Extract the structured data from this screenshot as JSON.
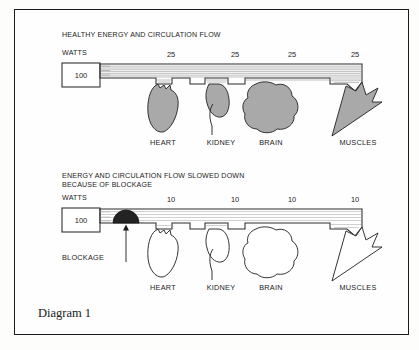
{
  "figure": {
    "caption": "Diagram 1",
    "border_color": "#1b1b1b",
    "background": "#fdfdfc"
  },
  "panels": [
    {
      "id": "healthy",
      "title": "HEALTHY ENERGY AND CIRCULATION FLOW",
      "units_label": "WATTS",
      "source_value": "100",
      "flow_state": "healthy",
      "organ_fill_color": "#a9a9a9",
      "branches": [
        {
          "label": "HEART",
          "watts": "25"
        },
        {
          "label": "KIDNEY",
          "watts": "25"
        },
        {
          "label": "BRAIN",
          "watts": "25"
        },
        {
          "label": "MUSCLES",
          "watts": "25"
        }
      ]
    },
    {
      "id": "blocked",
      "title_line1": "ENERGY AND CIRCULATION FLOW SLOWED DOWN",
      "title_line2": "BECAUSE OF BLOCKAGE",
      "units_label": "WATTS",
      "source_value": "100",
      "flow_state": "blocked",
      "organ_fill_color": "#ffffff",
      "blockage_label": "BLOCKAGE",
      "blockage_color": "#232323",
      "branches": [
        {
          "label": "HEART",
          "watts": "10"
        },
        {
          "label": "KIDNEY",
          "watts": "10"
        },
        {
          "label": "BRAIN",
          "watts": "10"
        },
        {
          "label": "MUSCLES",
          "watts": "10"
        }
      ]
    }
  ]
}
